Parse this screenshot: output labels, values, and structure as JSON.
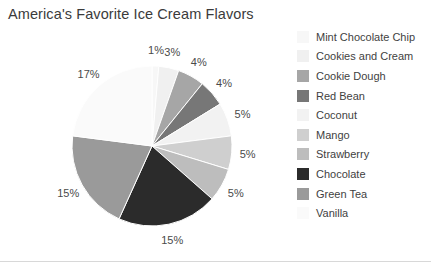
{
  "chart_data": {
    "type": "pie",
    "title": "America's Favorite Ice Cream Flavors",
    "xlabel": "",
    "ylabel": "",
    "legend_position": "right",
    "grid": false,
    "start_angle_deg": 0,
    "direction": "clockwise",
    "categories": [
      "Mint Chocolate Chip",
      "Cookies and Cream",
      "Cookie Dough",
      "Red Bean",
      "Coconut",
      "Mango",
      "Strawberry",
      "Chocolate",
      "Green Tea",
      "Vanilla"
    ],
    "values": [
      1,
      3,
      4,
      4,
      5,
      5,
      5,
      15,
      15,
      17
    ],
    "data_labels": [
      "1%",
      "3%",
      "4%",
      "4%",
      "5%",
      "5%",
      "5%",
      "15%",
      "15%",
      "17%"
    ],
    "colors": [
      "#f7f7f7",
      "#f0f0f0",
      "#a6a6a6",
      "#777777",
      "#f2f2f2",
      "#cfcfcf",
      "#bdbdbd",
      "#2b2b2b",
      "#9a9a9a",
      "#fafafa"
    ]
  },
  "legend": {
    "items": [
      {
        "label": "Mint Chocolate Chip",
        "color": "#f7f7f7"
      },
      {
        "label": "Cookies and Cream",
        "color": "#f0f0f0"
      },
      {
        "label": "Cookie Dough",
        "color": "#a6a6a6"
      },
      {
        "label": "Red Bean",
        "color": "#777777"
      },
      {
        "label": "Coconut",
        "color": "#f2f2f2"
      },
      {
        "label": "Mango",
        "color": "#cfcfcf"
      },
      {
        "label": "Strawberry",
        "color": "#bdbdbd"
      },
      {
        "label": "Chocolate",
        "color": "#2b2b2b"
      },
      {
        "label": "Green Tea",
        "color": "#9a9a9a"
      },
      {
        "label": "Vanilla",
        "color": "#fafafa"
      }
    ]
  },
  "geometry": {
    "center_x": 152,
    "center_y": 146,
    "radius": 80,
    "label_radius": 96
  }
}
